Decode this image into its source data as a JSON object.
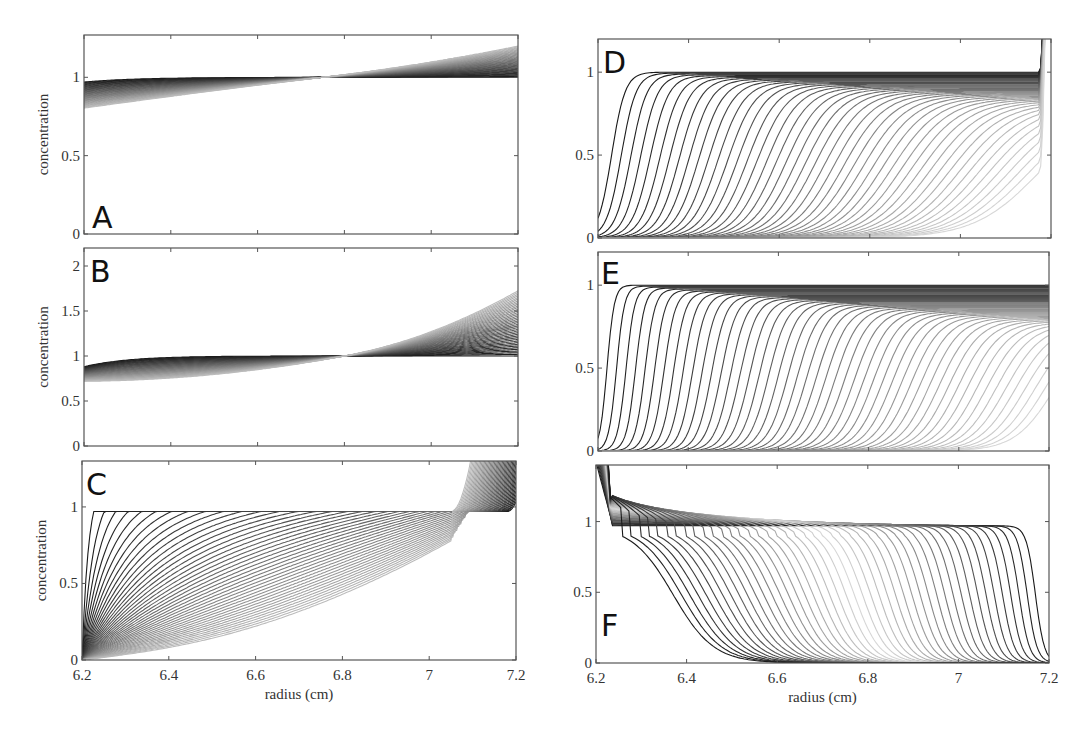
{
  "chart_data": [
    {
      "panel": "A",
      "type": "line",
      "title": "",
      "xlabel": "",
      "ylabel": "concentration",
      "xlim": [
        6.2,
        7.2
      ],
      "ylim": [
        0,
        1.27
      ],
      "xticks": [
        6.2,
        6.4,
        6.6,
        6.8,
        7.0,
        7.2
      ],
      "xtick_labels_shown": false,
      "yticks": [
        0,
        0.5,
        1
      ],
      "ytick_labels": [
        "0",
        "0.5",
        "1"
      ],
      "grid": false,
      "legend": null,
      "description": "Family of ~40 nearly flat concentration profiles crossing at r≈6.75; early curves ≈1, late curves tilt from ≈0.83 at 6.2 to ≈1.2 at 7.2",
      "series_summary": {
        "count": 40,
        "left_end_range": [
          0.83,
          0.97
        ],
        "right_end_range": [
          1.0,
          1.2
        ],
        "crossover_x": 6.75,
        "crossover_y": 1.0
      }
    },
    {
      "panel": "B",
      "type": "line",
      "xlabel": "",
      "ylabel": "concentration",
      "xlim": [
        6.2,
        7.2
      ],
      "ylim": [
        0,
        2.2
      ],
      "xticks": [
        6.2,
        6.4,
        6.6,
        6.8,
        7.0,
        7.2
      ],
      "xtick_labels_shown": false,
      "yticks": [
        0,
        0.5,
        1,
        1.5,
        2
      ],
      "ytick_labels": [
        "0",
        "0.5",
        "1",
        "1.5",
        "2"
      ],
      "grid": false,
      "legend": null,
      "description": "Family of curves crossing at r≈6.8, y=1; left ends span 0.45–0.9, right ends span 1.05–2.0",
      "series_summary": {
        "count": 40,
        "left_end_range": [
          0.45,
          0.9
        ],
        "right_end_range": [
          1.05,
          2.0
        ],
        "crossover_x": 6.8,
        "crossover_y": 1.0
      }
    },
    {
      "panel": "C",
      "type": "line",
      "xlabel": "radius (cm)",
      "ylabel": "concentration",
      "xlim": [
        6.2,
        7.2
      ],
      "ylim": [
        0,
        1.3
      ],
      "xticks": [
        6.2,
        6.4,
        6.6,
        6.8,
        7.0,
        7.2
      ],
      "xtick_labels": [
        "6.2",
        "6.4",
        "6.6",
        "6.8",
        "7",
        "7.2"
      ],
      "yticks": [
        0,
        0.5,
        1
      ],
      "ytick_labels": [
        "0",
        "0.5",
        "1"
      ],
      "grid": false,
      "legend": null,
      "description": "Sedimentation boundary: curves rise from 0 near meniscus to plateau ≈0.97; plateau drops over time; all curves converge near r≈7.03 then rise steeply off-scale near bottom (7.05–7.18)",
      "series_summary": {
        "count": 45,
        "plateau": 0.97,
        "convergence_x": 7.03,
        "pileup_start_range": [
          7.05,
          7.18
        ]
      }
    },
    {
      "panel": "D",
      "type": "line",
      "xlabel": "",
      "ylabel": "",
      "xlim": [
        6.2,
        7.2
      ],
      "ylim": [
        0,
        1.2
      ],
      "xticks": [
        6.2,
        6.4,
        6.6,
        6.8,
        7.0,
        7.2
      ],
      "xtick_labels_shown": false,
      "yticks": [
        0,
        0.5,
        1
      ],
      "ytick_labels": [
        "0",
        "0.5",
        "1"
      ],
      "grid": false,
      "legend": null,
      "description": "Moving sigmoidal boundaries migrating outward from 6.2 toward 7.17; plateau decays from 1.0 to ≈0.77; sharp pileup at bottom ≈7.18",
      "series_summary": {
        "count": 45,
        "boundary_start": 6.22,
        "boundary_end": 7.17,
        "plateau_start": 1.0,
        "plateau_end": 0.77
      }
    },
    {
      "panel": "E",
      "type": "line",
      "xlabel": "",
      "ylabel": "",
      "xlim": [
        6.2,
        7.2
      ],
      "ylim": [
        0,
        1.2
      ],
      "xticks": [
        6.2,
        6.4,
        6.6,
        6.8,
        7.0,
        7.2
      ],
      "xtick_labels_shown": false,
      "yticks": [
        0,
        0.5,
        1
      ],
      "ytick_labels": [
        "0",
        "0.5",
        "1"
      ],
      "grid": false,
      "legend": null,
      "description": "Steep moving boundaries migrating outward; plateau decays from 1.0 to ≈0.73",
      "series_summary": {
        "count": 48,
        "boundary_start": 6.21,
        "boundary_end": 7.2,
        "plateau_start": 1.0,
        "plateau_end": 0.73
      }
    },
    {
      "panel": "F",
      "type": "line",
      "xlabel": "radius (cm)",
      "ylabel": "",
      "xlim": [
        6.2,
        7.2
      ],
      "ylim": [
        0,
        1.4
      ],
      "xticks": [
        6.2,
        6.4,
        6.6,
        6.8,
        7.0,
        7.2
      ],
      "xtick_labels": [
        "6.2",
        "6.4",
        "6.6",
        "6.8",
        "7",
        "7.2"
      ],
      "yticks": [
        0,
        0.5,
        1
      ],
      "ytick_labels": [
        "0",
        "0.5",
        "1"
      ],
      "grid": false,
      "legend": null,
      "description": "Flotation: boundaries move inward from 7.2 toward 6.3; concentration near meniscus rises above 1 (up to ≈1.2) with spike at 6.22; plateau ≈0.97",
      "series_summary": {
        "count": 45,
        "boundary_start": 7.18,
        "boundary_end": 6.4,
        "plateau": 0.97,
        "meniscus_peak": 1.22
      }
    }
  ],
  "panels": [
    {
      "id": "A",
      "letter": "A",
      "ylabel": "concentration",
      "show_ylabel": true,
      "show_xticklabels": false,
      "box": {
        "x": 84,
        "y": 35,
        "w": 434,
        "h": 199
      },
      "ylim": [
        0,
        1.27
      ],
      "yticks": [
        "0",
        "0.5",
        "1"
      ],
      "ytick_values": [
        0,
        0.5,
        1
      ],
      "letter_pos": {
        "x": 92,
        "y": 228
      }
    },
    {
      "id": "B",
      "letter": "B",
      "ylabel": "concentration",
      "show_ylabel": true,
      "show_xticklabels": false,
      "box": {
        "x": 84,
        "y": 248,
        "w": 434,
        "h": 198
      },
      "ylim": [
        0,
        2.2
      ],
      "yticks": [
        "0",
        "0.5",
        "1",
        "1.5",
        "2"
      ],
      "ytick_values": [
        0,
        0.5,
        1,
        1.5,
        2
      ],
      "letter_pos": {
        "x": 90,
        "y": 282
      }
    },
    {
      "id": "C",
      "letter": "C",
      "ylabel": "concentration",
      "show_ylabel": true,
      "show_xticklabels": true,
      "box": {
        "x": 82,
        "y": 461,
        "w": 434,
        "h": 199
      },
      "ylim": [
        0,
        1.3
      ],
      "yticks": [
        "0",
        "0.5",
        "1"
      ],
      "ytick_values": [
        0,
        0.5,
        1
      ],
      "letter_pos": {
        "x": 86,
        "y": 495
      }
    },
    {
      "id": "D",
      "letter": "D",
      "ylabel": "",
      "show_ylabel": false,
      "show_xticklabels": false,
      "box": {
        "x": 598,
        "y": 39,
        "w": 453,
        "h": 199
      },
      "ylim": [
        0,
        1.2
      ],
      "yticks": [
        "0",
        "0.5",
        "1"
      ],
      "ytick_values": [
        0,
        0.5,
        1
      ],
      "letter_pos": {
        "x": 603,
        "y": 73
      }
    },
    {
      "id": "E",
      "letter": "E",
      "ylabel": "",
      "show_ylabel": false,
      "show_xticklabels": false,
      "box": {
        "x": 598,
        "y": 252,
        "w": 451,
        "h": 199
      },
      "ylim": [
        0,
        1.2
      ],
      "yticks": [
        "0",
        "0.5",
        "1"
      ],
      "ytick_values": [
        0,
        0.5,
        1
      ],
      "letter_pos": {
        "x": 601,
        "y": 284
      }
    },
    {
      "id": "F",
      "letter": "F",
      "ylabel": "",
      "show_ylabel": false,
      "show_xticklabels": true,
      "box": {
        "x": 596,
        "y": 465,
        "w": 453,
        "h": 198
      },
      "ylim": [
        0,
        1.4
      ],
      "yticks": [
        "0",
        "0.5",
        "1"
      ],
      "ytick_values": [
        0,
        0.5,
        1
      ],
      "letter_pos": {
        "x": 601,
        "y": 636
      }
    }
  ],
  "xaxis": {
    "xlim": [
      6.2,
      7.2
    ],
    "tick_values": [
      6.2,
      6.4,
      6.6,
      6.8,
      7.0,
      7.2
    ],
    "tick_labels": [
      "6.2",
      "6.4",
      "6.6",
      "6.8",
      "7",
      "7.2"
    ],
    "title": "radius (cm)"
  },
  "colors": {
    "axes": "#555555",
    "curve_dark": "#1a1a1a",
    "curve_light": "#d8d8d8",
    "background": "#ffffff"
  }
}
